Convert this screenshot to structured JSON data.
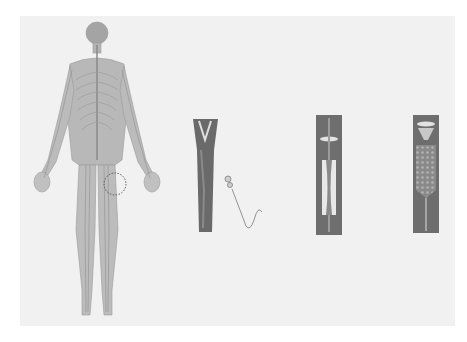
{
  "figure": {
    "background_color": "#f1f1f1",
    "body_color": "#a8a8a8",
    "vessel_wall_color": "#6e6e6e",
    "lumen_color": "#9a9a9a",
    "highlight_color": "#e6e6e6",
    "caption": ""
  },
  "elements": [
    {
      "name": "human-figure",
      "description": "Full-body anatomical figure showing nerve/vessel network"
    },
    {
      "name": "highlight-circle",
      "description": "Dotted circle marking region on left thigh"
    },
    {
      "name": "branching-vessel",
      "description": "Y-shaped branching blood vessel"
    },
    {
      "name": "catheter",
      "description": "Catheter with hub and curved wire"
    },
    {
      "name": "balloon-vessel",
      "description": "Vessel section with balloon/guidewire inserted"
    },
    {
      "name": "stent-vessel",
      "description": "Vessel section with mesh stent deployed"
    }
  ]
}
